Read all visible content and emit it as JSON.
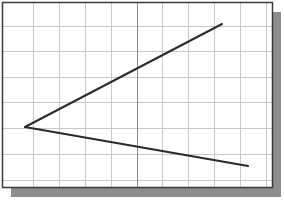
{
  "figure": {
    "colors": {
      "background": "#ffffff",
      "grid": "#c8c8c8",
      "axis": "#8a8a8a",
      "border": "#3a3a3a",
      "shadow": "#8c8c8c",
      "line": "#2a2a2a"
    },
    "frame": {
      "x": 3,
      "y": 3,
      "width": 270,
      "height": 185
    },
    "shadow": {
      "offset_x": 8,
      "offset_y": 9
    },
    "grid": {
      "vertical_x": [
        33,
        59,
        85,
        111,
        162,
        188,
        214,
        240,
        266
      ],
      "horizontal_y": [
        26,
        51,
        77,
        102,
        128,
        154,
        180
      ],
      "center_axis_x": 137
    },
    "vertex": {
      "x": 25,
      "y": 127
    },
    "segments": [
      {
        "name": "upper-ray",
        "x1": 25,
        "y1": 127,
        "x2": 222,
        "y2": 24
      },
      {
        "name": "lower-ray",
        "x1": 25,
        "y1": 127,
        "x2": 248,
        "y2": 166
      }
    ]
  }
}
